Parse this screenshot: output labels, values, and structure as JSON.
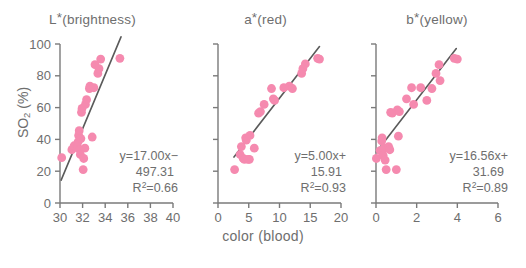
{
  "figure": {
    "xlabel": "color (blood)",
    "ylabel_main": "SO",
    "ylabel_sub": "2",
    "ylabel_unit": " (%)",
    "marker_color": "#F58AAF",
    "line_color": "#5a5a5a",
    "axis_color": "#7a7a7a",
    "text_color": "#6e6e6e"
  },
  "chart_data": [
    {
      "type": "scatter",
      "title": "L*(brightness)",
      "title_base": "L",
      "title_star": "*",
      "title_rest": "(brightness)",
      "xlabel": "color (blood)",
      "ylabel": "SO2 (%)",
      "xlim": [
        30,
        40
      ],
      "ylim": [
        0,
        100
      ],
      "xticks": [
        30,
        32,
        34,
        36,
        38,
        40
      ],
      "yticks": [
        0,
        20,
        40,
        60,
        80,
        100
      ],
      "grid": false,
      "equation": "y=17.00x−",
      "equation_line2": "497.31",
      "r2_label": "R",
      "r2_sup": "2",
      "r2_value": "=0.66",
      "slope": 17.0,
      "intercept": -497.31,
      "r_squared": 0.66,
      "fit_line_x": [
        30.1,
        35.4
      ],
      "points": [
        {
          "x": 30.15,
          "y": 28.5
        },
        {
          "x": 31.05,
          "y": 33.5
        },
        {
          "x": 31.25,
          "y": 36.0
        },
        {
          "x": 31.55,
          "y": 35.0
        },
        {
          "x": 31.6,
          "y": 38.5
        },
        {
          "x": 31.65,
          "y": 42.5
        },
        {
          "x": 31.7,
          "y": 45.5
        },
        {
          "x": 31.75,
          "y": 33.5
        },
        {
          "x": 31.8,
          "y": 30.5
        },
        {
          "x": 31.85,
          "y": 40.5
        },
        {
          "x": 31.9,
          "y": 57.0
        },
        {
          "x": 31.95,
          "y": 59.5
        },
        {
          "x": 32.05,
          "y": 21.0
        },
        {
          "x": 32.1,
          "y": 28.0
        },
        {
          "x": 32.2,
          "y": 34.5
        },
        {
          "x": 32.25,
          "y": 62.0
        },
        {
          "x": 32.35,
          "y": 65.0
        },
        {
          "x": 32.6,
          "y": 72.0
        },
        {
          "x": 32.65,
          "y": 73.5
        },
        {
          "x": 32.85,
          "y": 41.5
        },
        {
          "x": 33.0,
          "y": 72.5
        },
        {
          "x": 33.1,
          "y": 87.0
        },
        {
          "x": 33.35,
          "y": 81.5
        },
        {
          "x": 33.45,
          "y": 84.5
        },
        {
          "x": 33.6,
          "y": 90.5
        },
        {
          "x": 35.3,
          "y": 91.0
        }
      ]
    },
    {
      "type": "scatter",
      "title": "a*(red)",
      "title_base": "a",
      "title_star": "*",
      "title_rest": "(red)",
      "xlabel": "color (blood)",
      "ylabel": "SO2 (%)",
      "xlim": [
        0,
        20
      ],
      "ylim": [
        0,
        100
      ],
      "xticks": [
        0,
        5,
        10,
        15,
        20
      ],
      "yticks": [
        0,
        20,
        40,
        60,
        80,
        100
      ],
      "grid": false,
      "equation": "y=5.00x+",
      "equation_line2": "15.91",
      "r2_label": "R",
      "r2_sup": "2",
      "r2_value": "=0.93",
      "slope": 5.0,
      "intercept": 15.91,
      "r_squared": 0.93,
      "fit_line_x": [
        2.6,
        16.5
      ],
      "points": [
        {
          "x": 2.7,
          "y": 21.0
        },
        {
          "x": 3.6,
          "y": 30.5
        },
        {
          "x": 3.8,
          "y": 35.5
        },
        {
          "x": 4.1,
          "y": 28.0
        },
        {
          "x": 4.3,
          "y": 27.5
        },
        {
          "x": 4.5,
          "y": 41.0
        },
        {
          "x": 4.6,
          "y": 39.5
        },
        {
          "x": 4.9,
          "y": 27.5
        },
        {
          "x": 5.1,
          "y": 27.5
        },
        {
          "x": 5.2,
          "y": 42.5
        },
        {
          "x": 5.9,
          "y": 34.5
        },
        {
          "x": 6.6,
          "y": 56.5
        },
        {
          "x": 6.9,
          "y": 57.5
        },
        {
          "x": 7.5,
          "y": 62.0
        },
        {
          "x": 8.7,
          "y": 72.0
        },
        {
          "x": 9.0,
          "y": 65.5
        },
        {
          "x": 9.2,
          "y": 64.5
        },
        {
          "x": 10.7,
          "y": 72.5
        },
        {
          "x": 11.6,
          "y": 73.5
        },
        {
          "x": 12.1,
          "y": 72.0
        },
        {
          "x": 13.6,
          "y": 81.5
        },
        {
          "x": 13.8,
          "y": 84.5
        },
        {
          "x": 14.2,
          "y": 87.5
        },
        {
          "x": 16.2,
          "y": 91.0
        },
        {
          "x": 16.5,
          "y": 90.5
        }
      ]
    },
    {
      "type": "scatter",
      "title": "b*(yellow)",
      "title_base": "b",
      "title_star": "*",
      "title_rest": "(yellow)",
      "xlabel": "color (blood)",
      "ylabel": "SO2 (%)",
      "xlim": [
        0,
        6
      ],
      "ylim": [
        0,
        100
      ],
      "xticks": [
        0,
        2,
        4,
        6
      ],
      "yticks": [
        0,
        20,
        40,
        60,
        80,
        100
      ],
      "grid": false,
      "equation": "y=16.56x+",
      "equation_line2": "31.69",
      "r2_label": "R",
      "r2_sup": "2",
      "r2_value": "=0.89",
      "slope": 16.56,
      "intercept": 31.69,
      "r_squared": 0.89,
      "fit_line_x": [
        0.02,
        3.95
      ],
      "points": [
        {
          "x": 0.02,
          "y": 28.0
        },
        {
          "x": 0.2,
          "y": 33.0
        },
        {
          "x": 0.28,
          "y": 39.0
        },
        {
          "x": 0.3,
          "y": 41.0
        },
        {
          "x": 0.35,
          "y": 30.0
        },
        {
          "x": 0.4,
          "y": 34.5
        },
        {
          "x": 0.45,
          "y": 27.0
        },
        {
          "x": 0.5,
          "y": 21.0
        },
        {
          "x": 0.62,
          "y": 35.5
        },
        {
          "x": 0.68,
          "y": 33.5
        },
        {
          "x": 0.72,
          "y": 57.0
        },
        {
          "x": 0.8,
          "y": 56.5
        },
        {
          "x": 1.0,
          "y": 21.0
        },
        {
          "x": 1.05,
          "y": 58.5
        },
        {
          "x": 1.1,
          "y": 42.0
        },
        {
          "x": 1.15,
          "y": 57.5
        },
        {
          "x": 1.5,
          "y": 65.5
        },
        {
          "x": 1.75,
          "y": 72.5
        },
        {
          "x": 1.85,
          "y": 62.0
        },
        {
          "x": 2.2,
          "y": 72.5
        },
        {
          "x": 2.5,
          "y": 64.5
        },
        {
          "x": 2.75,
          "y": 72.0
        },
        {
          "x": 2.95,
          "y": 81.5
        },
        {
          "x": 3.1,
          "y": 87.0
        },
        {
          "x": 3.15,
          "y": 77.0
        },
        {
          "x": 3.85,
          "y": 91.0
        },
        {
          "x": 4.0,
          "y": 90.5
        }
      ]
    }
  ]
}
